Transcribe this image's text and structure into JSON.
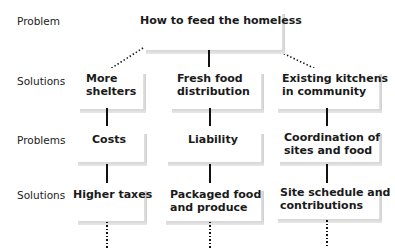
{
  "row_labels": [
    "Problem",
    "Solutions",
    "Problems",
    "Solutions"
  ],
  "root": {
    "label": "How to feed the homeless"
  },
  "columns": [
    {
      "solution": [
        "More",
        "shelters"
      ],
      "problem": [
        "Costs"
      ],
      "sub_solution": [
        "Higher taxes"
      ]
    },
    {
      "solution": [
        "Fresh food",
        "distribution"
      ],
      "problem": [
        "Liability"
      ],
      "sub_solution": [
        "Packaged food",
        "and produce"
      ]
    },
    {
      "solution": [
        "Existing kitchens",
        "in community"
      ],
      "problem": [
        "Coordination of",
        "sites and food"
      ],
      "sub_solution": [
        "Site schedule and",
        "contributions"
      ]
    }
  ],
  "colors": {
    "line": "#111111",
    "shadow": "#d4d4d4",
    "text": "#1a1a1a"
  }
}
